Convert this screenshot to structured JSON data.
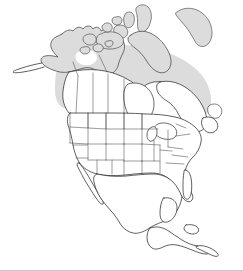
{
  "figure": {
    "kind": "map",
    "title": "North America",
    "projection_note": "continental outline map",
    "width": 243,
    "height": 271
  },
  "colors": {
    "background": "#ffffff",
    "outline": "#2b2b2b",
    "subdivision_line": "#4a4a4a",
    "shaded_fill": "#dcdcdc",
    "unshaded_fill": "#ffffff",
    "bottom_border": "#c9c9c9"
  },
  "legend": {
    "visible": false,
    "entries": []
  },
  "labels": {
    "visible": false,
    "items": []
  },
  "regions": [
    {
      "id": "alaska",
      "name": "Alaska",
      "shaded": true
    },
    {
      "id": "aleutian-chain",
      "name": "Aleutian Islands",
      "shaded": true
    },
    {
      "id": "yukon-nwt-band",
      "name": "Northern Canada Band",
      "shaded": true
    },
    {
      "id": "arctic-archipelago",
      "name": "Canadian Arctic Archipelago",
      "shaded": true
    },
    {
      "id": "baffin-island",
      "name": "Baffin Island",
      "shaded": true
    },
    {
      "id": "ellesmere-island",
      "name": "Ellesmere Island",
      "shaded": true
    },
    {
      "id": "quebec-labrador",
      "name": "Quebec and Labrador",
      "shaded": false
    },
    {
      "id": "hudson-bay",
      "name": "Hudson Bay",
      "shaded": false
    },
    {
      "id": "canada-provinces",
      "name": "Canadian Provinces",
      "shaded": false
    },
    {
      "id": "united-states",
      "name": "United States",
      "shaded": false
    },
    {
      "id": "great-lakes",
      "name": "Great Lakes",
      "shaded": false
    },
    {
      "id": "baja-california",
      "name": "Baja California",
      "shaded": false
    },
    {
      "id": "mexico",
      "name": "Mexico",
      "shaded": false
    },
    {
      "id": "yucatan",
      "name": "Yucatan Peninsula",
      "shaded": false
    },
    {
      "id": "central-america",
      "name": "Central America",
      "shaded": false
    },
    {
      "id": "newfoundland",
      "name": "Newfoundland",
      "shaded": false
    },
    {
      "id": "caribbean-islet",
      "name": "Caribbean Island",
      "shaded": false
    }
  ]
}
